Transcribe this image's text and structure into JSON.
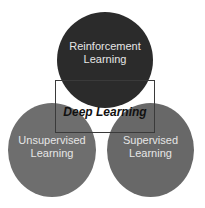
{
  "diagram": {
    "circles": [
      {
        "id": "top",
        "label_line1": "Reinforcement",
        "label_line2": "Learning",
        "color": "#2b2b2b"
      },
      {
        "id": "left",
        "label_line1": "Unsupervised",
        "label_line2": "Learning",
        "color": "#6e6e6e"
      },
      {
        "id": "right",
        "label_line1": "Supervised",
        "label_line2": "Learning",
        "color": "#686868"
      }
    ],
    "center_label": "Deep Learning"
  }
}
